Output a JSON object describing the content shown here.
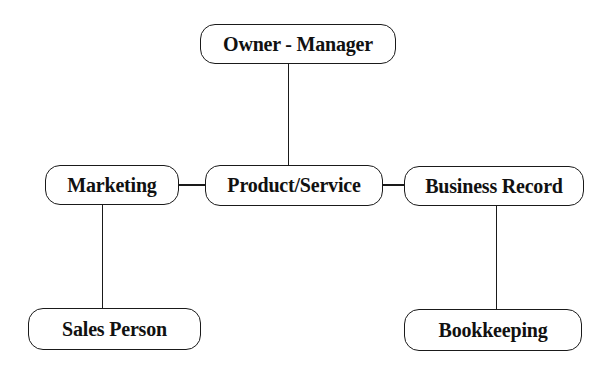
{
  "diagram": {
    "type": "org-chart",
    "colors": {
      "stroke": "#1a1a1a",
      "text": "#111111",
      "background": "#ffffff"
    },
    "nodes": {
      "owner_manager": {
        "label": "Owner - Manager",
        "x": 200,
        "y": 24,
        "w": 196,
        "h": 40
      },
      "marketing": {
        "label": "Marketing",
        "x": 45,
        "y": 165,
        "w": 134,
        "h": 40
      },
      "product_service": {
        "label": "Product/Service",
        "x": 205,
        "y": 165,
        "w": 178,
        "h": 41
      },
      "business_record": {
        "label": "Business Record",
        "x": 404,
        "y": 166,
        "w": 180,
        "h": 40
      },
      "sales_person": {
        "label": "Sales Person",
        "x": 28,
        "y": 308,
        "w": 173,
        "h": 42
      },
      "bookkeeping": {
        "label": "Bookkeeping",
        "x": 404,
        "y": 309,
        "w": 178,
        "h": 42
      }
    },
    "edges": [
      {
        "from": "owner_manager",
        "to": "product_service"
      },
      {
        "from": "marketing",
        "to": "product_service"
      },
      {
        "from": "product_service",
        "to": "business_record"
      },
      {
        "from": "marketing",
        "to": "sales_person"
      },
      {
        "from": "business_record",
        "to": "bookkeeping"
      }
    ]
  }
}
